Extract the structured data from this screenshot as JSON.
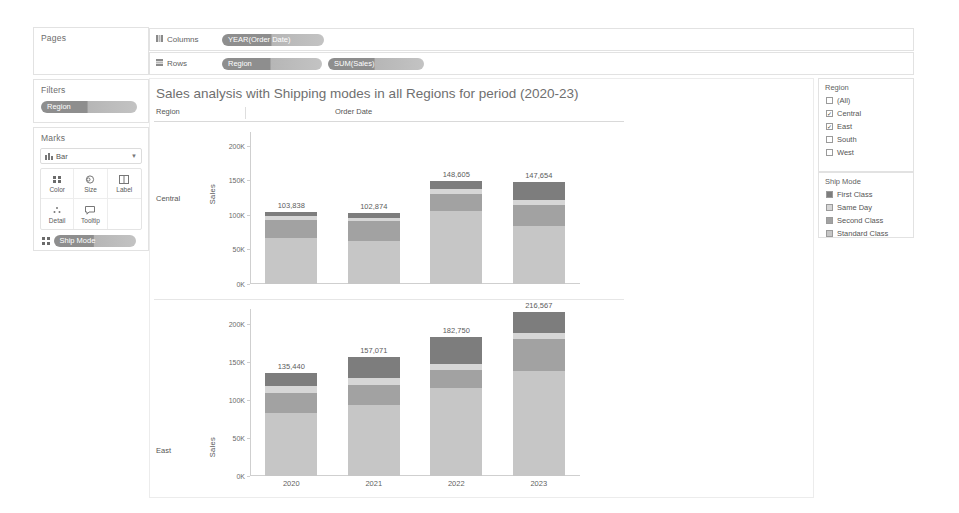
{
  "shelves": {
    "columns_label": "Columns",
    "rows_label": "Rows",
    "columns_pills": [
      "YEAR(Order Date)"
    ],
    "rows_pills": [
      "Region",
      "SUM(Sales)"
    ]
  },
  "pages": {
    "title": "Pages"
  },
  "filters": {
    "title": "Filters",
    "pills": [
      "Region"
    ]
  },
  "marks": {
    "title": "Marks",
    "type": "Bar",
    "buttons": [
      "Color",
      "Size",
      "Label",
      "Detail",
      "Tooltip"
    ],
    "encoding_pills": [
      "Ship Mode"
    ]
  },
  "viz": {
    "title": "Sales analysis with Shipping modes in all Regions for period (2020-23)",
    "corner_header": "Region",
    "column_header": "Order Date",
    "axis_title": "Sales",
    "row_headers": [
      "Central",
      "East"
    ]
  },
  "legend_region": {
    "title": "Region",
    "items": [
      {
        "label": "(All)",
        "checked": false
      },
      {
        "label": "Central",
        "checked": true
      },
      {
        "label": "East",
        "checked": true
      },
      {
        "label": "South",
        "checked": false
      },
      {
        "label": "West",
        "checked": false
      }
    ]
  },
  "legend_ship": {
    "title": "Ship Mode",
    "items": [
      {
        "label": "First Class",
        "color": "#7d7d7d"
      },
      {
        "label": "Same Day",
        "color": "#d6d6d6"
      },
      {
        "label": "Second Class",
        "color": "#a2a2a2"
      },
      {
        "label": "Standard Class",
        "color": "#c6c6c6"
      }
    ]
  },
  "chart_data": {
    "type": "bar",
    "stacked": true,
    "title": "Sales analysis with Shipping modes in all Regions for period (2020-23)",
    "xlabel": "Order Date",
    "ylabel": "Sales",
    "ylim": [
      0,
      220000
    ],
    "yticks": [
      "0K",
      "50K",
      "100K",
      "150K",
      "200K"
    ],
    "ytick_values": [
      0,
      50000,
      100000,
      150000,
      200000
    ],
    "categories": [
      "2020",
      "2021",
      "2022",
      "2023"
    ],
    "grid": false,
    "legend_position": "right",
    "series_order": [
      "Standard Class",
      "Second Class",
      "Same Day",
      "First Class"
    ],
    "panels": [
      {
        "row": "Central",
        "totals": [
          103838,
          102874,
          148605,
          147654
        ],
        "total_labels": [
          "103,838",
          "102,874",
          "148,605",
          "147,654"
        ],
        "series": [
          {
            "name": "Standard Class",
            "color": "#c6c6c6",
            "values": [
              66500,
              62000,
              105000,
              84500
            ]
          },
          {
            "name": "Second Class",
            "color": "#a2a2a2",
            "values": [
              26000,
              28500,
              26000,
              30500
            ]
          },
          {
            "name": "Same Day",
            "color": "#d6d6d6",
            "values": [
              5300,
              5000,
              6000,
              7000
            ]
          },
          {
            "name": "First Class",
            "color": "#7d7d7d",
            "values": [
              6038,
              7374,
              11605,
              25654
            ]
          }
        ]
      },
      {
        "row": "East",
        "totals": [
          135440,
          157071,
          182750,
          216567
        ],
        "total_labels": [
          "135,440",
          "157,071",
          "182,750",
          "216,567"
        ],
        "series": [
          {
            "name": "Standard Class",
            "color": "#c6c6c6",
            "values": [
              83000,
              93000,
              116000,
              139000
            ]
          },
          {
            "name": "Second Class",
            "color": "#a2a2a2",
            "values": [
              26000,
              27000,
              24000,
              42000
            ]
          },
          {
            "name": "Same Day",
            "color": "#d6d6d6",
            "values": [
              10000,
              9500,
              8000,
              8000
            ]
          },
          {
            "name": "First Class",
            "color": "#7d7d7d",
            "values": [
              16440,
              27571,
              34750,
              27567
            ]
          }
        ]
      }
    ]
  }
}
